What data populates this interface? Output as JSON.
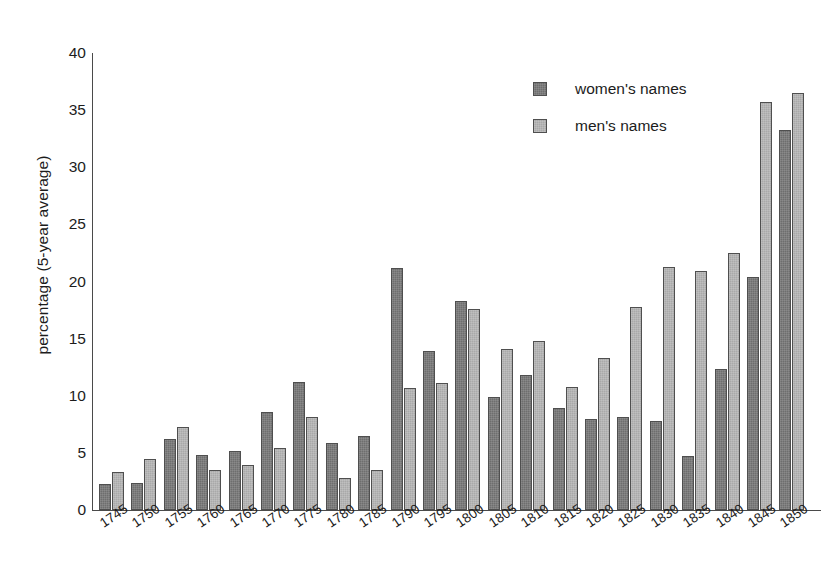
{
  "chart_data": {
    "type": "bar",
    "title": "",
    "subtitle": "",
    "xlabel": "",
    "ylabel": "percentage (5-year average)",
    "ylim": [
      0,
      40
    ],
    "ytick_labels": [
      "0",
      "5",
      "10",
      "15",
      "20",
      "25",
      "30",
      "35",
      "40"
    ],
    "ytick_values": [
      0,
      5,
      10,
      15,
      20,
      25,
      30,
      35,
      40
    ],
    "grid": false,
    "legend_position": "top-right",
    "categories": [
      "1745",
      "1750",
      "1755",
      "1760",
      "1765",
      "1770",
      "1775",
      "1780",
      "1785",
      "1790",
      "1795",
      "1800",
      "1805",
      "1810",
      "1815",
      "1820",
      "1825",
      "1830",
      "1835",
      "1840",
      "1845",
      "1850"
    ],
    "series": [
      {
        "name": "women's names",
        "color": "#6e6e6e",
        "values": [
          2.3,
          2.4,
          6.2,
          4.8,
          5.2,
          8.6,
          11.2,
          5.9,
          6.5,
          21.2,
          13.9,
          18.3,
          9.9,
          11.8,
          8.9,
          8.0,
          8.1,
          7.8,
          4.7,
          12.3,
          20.4,
          33.3
        ]
      },
      {
        "name": "men's names",
        "color": "#a9a9a9",
        "values": [
          3.3,
          4.5,
          7.3,
          3.5,
          3.9,
          5.4,
          8.1,
          2.8,
          3.5,
          10.7,
          11.1,
          17.6,
          14.1,
          14.8,
          10.8,
          13.3,
          17.8,
          21.3,
          20.9,
          22.5,
          35.7,
          36.5
        ]
      }
    ]
  },
  "legend": {
    "items": [
      {
        "label": "women's names",
        "swatch": "women"
      },
      {
        "label": "men's names",
        "swatch": "men"
      }
    ]
  }
}
